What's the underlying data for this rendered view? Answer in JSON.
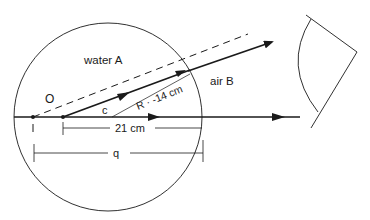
{
  "diagram": {
    "type": "optics-refraction-spherical-surface",
    "labels": {
      "medium_inside": "water A",
      "medium_outside": "air B",
      "object_point": "O",
      "image_point": "I",
      "center_label": "c",
      "radius": "R · -14 cm",
      "distance_c_to_surface": "21 cm",
      "image_distance": "q"
    },
    "colors": {
      "stroke": "#1a1a1a",
      "background": "#ffffff"
    }
  }
}
